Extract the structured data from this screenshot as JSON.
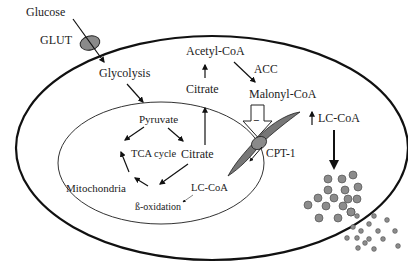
{
  "diagram": {
    "compartments": {
      "cell": "Cell",
      "mitochondria": "Mitochondria"
    },
    "labels": {
      "glucose": "Glucose",
      "glut": "GLUT",
      "glycolysis": "Glycolysis",
      "pyruvate": "Pyruvate",
      "tca_cycle": "TCA cycle",
      "citrate_mito": "Citrate",
      "citrate_cyto": "Citrate",
      "acetyl_coa": "Acetyl-CoA",
      "acc": "ACC",
      "malonyl_coa": "Malonyl-CoA",
      "inhibition_sign": "−",
      "lc_coa_cyto": "LC-CoA",
      "lc_coa_mito": "LC-CoA",
      "cpt1": "CPT-1",
      "beta_oxidation": "ß-oxidation",
      "mitochondria": "Mitochondria"
    },
    "colors": {
      "membrane": "#111111",
      "transporter_fill": "#8a8a8a",
      "droplet_fill": "#8c8c8c",
      "inhibition_arrow_fill": "#ffffff"
    }
  }
}
